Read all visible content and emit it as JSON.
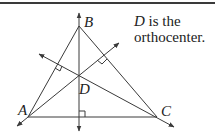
{
  "diagram": {
    "vertices": {
      "A": {
        "label": "A",
        "x": 28,
        "y": 117
      },
      "B": {
        "label": "B",
        "x": 79,
        "y": 26
      },
      "C": {
        "label": "C",
        "x": 157,
        "y": 117
      }
    },
    "orthocenter": {
      "label": "D",
      "x": 79,
      "y": 75
    },
    "altitudes": [
      {
        "from": "B",
        "to_side": "AC",
        "right_angle_marker": true
      },
      {
        "from": "A",
        "to_side": "BC",
        "right_angle_marker": true
      },
      {
        "from": "C",
        "to_side": "AB",
        "right_angle_marker": true
      }
    ],
    "note": {
      "italic_part": "D",
      "line1_rest": " is the",
      "line2": "orthocenter."
    },
    "colors": {
      "stroke": "#3a3a3a",
      "text": "#222222",
      "background": "#ffffff"
    }
  }
}
